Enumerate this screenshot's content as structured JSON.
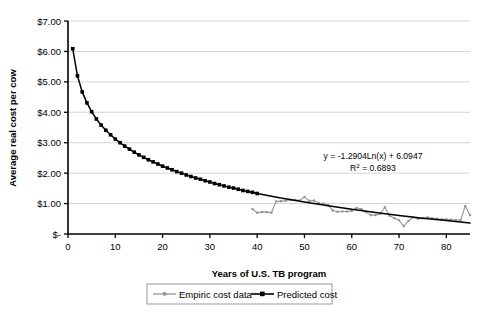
{
  "chart_data": {
    "type": "line",
    "title": "",
    "xlabel": "Years of U.S. TB program",
    "ylabel": "Average real cost per cow",
    "xlim": [
      0,
      85
    ],
    "ylim": [
      0,
      7
    ],
    "xticks": [
      "0",
      "10",
      "20",
      "30",
      "40",
      "50",
      "60",
      "70",
      "80"
    ],
    "xtick_values": [
      0,
      10,
      20,
      30,
      40,
      50,
      60,
      70,
      80
    ],
    "yticks": [
      "$-",
      "$1.00",
      "$2.00",
      "$3.00",
      "$4.00",
      "$5.00",
      "$6.00",
      "$7.00"
    ],
    "ytick_values": [
      0,
      1,
      2,
      3,
      4,
      5,
      6,
      7
    ],
    "grid": "horizontal",
    "legend_position": "bottom",
    "annotations": [
      {
        "name": "regression-equation",
        "text": "y = -1.2904Ln(x) + 6.0947",
        "x": 57,
        "y": 2.55
      },
      {
        "name": "r-squared",
        "text": "R2 = 0.6893",
        "r_label": "R",
        "r_exp": "2",
        "r_value": " = 0.6893",
        "x": 57,
        "y": 2.25
      }
    ],
    "series": [
      {
        "name": "Empiric cost data",
        "color": "#969696",
        "marker": "small-dash",
        "x": [
          39,
          40,
          41,
          42,
          43,
          44,
          45,
          46,
          47,
          48,
          49,
          50,
          51,
          52,
          53,
          54,
          55,
          56,
          57,
          58,
          59,
          60,
          61,
          62,
          63,
          64,
          65,
          66,
          67,
          68,
          69,
          70,
          71,
          72,
          73,
          74,
          75,
          76,
          77,
          78,
          79,
          80,
          81,
          82,
          83,
          84,
          85
        ],
        "values": [
          0.82,
          0.7,
          0.72,
          0.72,
          0.7,
          1.07,
          1.08,
          1.09,
          1.13,
          1.12,
          1.1,
          1.22,
          1.09,
          1.1,
          1.02,
          1.0,
          0.95,
          0.77,
          0.73,
          0.74,
          0.74,
          0.76,
          0.86,
          0.82,
          0.72,
          0.62,
          0.62,
          0.66,
          0.88,
          0.6,
          0.52,
          0.45,
          0.26,
          0.43,
          0.55,
          0.5,
          0.52,
          0.55,
          0.52,
          0.5,
          0.48,
          0.48,
          0.47,
          0.46,
          0.45,
          0.92,
          0.62
        ]
      },
      {
        "name": "Predicted cost",
        "color": "#000000",
        "marker": "square",
        "x": [
          1,
          2,
          3,
          4,
          5,
          6,
          7,
          8,
          9,
          10,
          11,
          12,
          13,
          14,
          15,
          16,
          17,
          18,
          19,
          20,
          21,
          22,
          23,
          24,
          25,
          26,
          27,
          28,
          29,
          30,
          31,
          32,
          33,
          34,
          35,
          36,
          37,
          38,
          39,
          40,
          45,
          50,
          55,
          60,
          65,
          70,
          75,
          80,
          85
        ],
        "values": [
          6.09,
          5.2,
          4.67,
          4.31,
          4.02,
          3.78,
          3.58,
          3.41,
          3.26,
          3.12,
          3.0,
          2.89,
          2.79,
          2.69,
          2.6,
          2.52,
          2.44,
          2.37,
          2.3,
          2.23,
          2.17,
          2.11,
          2.05,
          2.0,
          1.94,
          1.89,
          1.84,
          1.8,
          1.75,
          1.71,
          1.66,
          1.62,
          1.58,
          1.54,
          1.51,
          1.47,
          1.43,
          1.4,
          1.37,
          1.33,
          1.18,
          1.05,
          0.93,
          0.81,
          0.71,
          0.61,
          0.52,
          0.44,
          0.36
        ]
      }
    ]
  },
  "legend": {
    "items": [
      {
        "label": "Empiric cost data",
        "color": "#969696"
      },
      {
        "label": "Predicted cost",
        "color": "#000000"
      }
    ]
  },
  "caption": {
    "text": ""
  }
}
